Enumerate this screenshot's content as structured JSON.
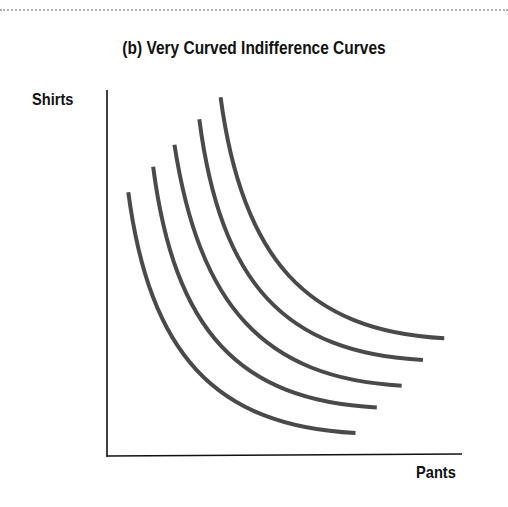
{
  "figure": {
    "title": "(b) Very Curved Indifference Curves",
    "x_axis_label": "Pants",
    "y_axis_label": "Shirts"
  },
  "colors": {
    "curve": "#4a4a4a",
    "axis": "#111111",
    "text": "#111111",
    "rule": "#b0b0b0"
  },
  "chart_data": {
    "type": "line",
    "title": "(b) Very Curved Indifference Curves",
    "xlabel": "Pants",
    "ylabel": "Shirts",
    "grid": false,
    "legend": null,
    "ticks": "none",
    "series": [
      {
        "name": "Indifference curve 1 (lowest)",
        "points": [
          [
            0.06,
            0.72
          ],
          [
            0.12,
            0.28
          ],
          [
            0.3,
            0.08
          ],
          [
            0.7,
            0.06
          ]
        ]
      },
      {
        "name": "Indifference curve 2",
        "points": [
          [
            0.13,
            0.79
          ],
          [
            0.19,
            0.34
          ],
          [
            0.37,
            0.15
          ],
          [
            0.76,
            0.13
          ]
        ]
      },
      {
        "name": "Indifference curve 3",
        "points": [
          [
            0.19,
            0.85
          ],
          [
            0.26,
            0.41
          ],
          [
            0.44,
            0.21
          ],
          [
            0.83,
            0.19
          ]
        ]
      },
      {
        "name": "Indifference curve 4",
        "points": [
          [
            0.26,
            0.92
          ],
          [
            0.32,
            0.47
          ],
          [
            0.5,
            0.28
          ],
          [
            0.89,
            0.26
          ]
        ]
      },
      {
        "name": "Indifference curve 5 (highest)",
        "points": [
          [
            0.32,
            0.98
          ],
          [
            0.38,
            0.54
          ],
          [
            0.56,
            0.34
          ],
          [
            0.95,
            0.32
          ]
        ]
      }
    ]
  }
}
